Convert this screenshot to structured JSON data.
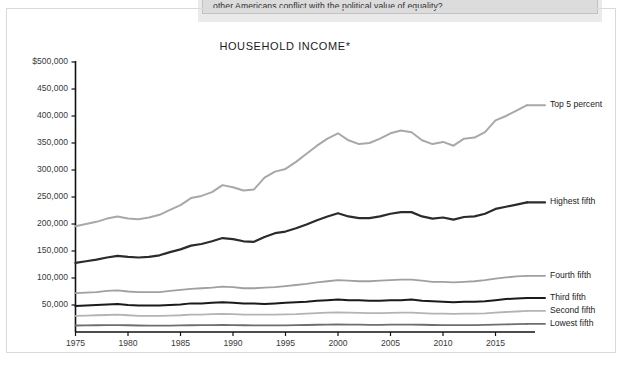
{
  "page": {
    "question_text": "other Americans conflict with the political value of equality?"
  },
  "chart_data": {
    "type": "line",
    "title": "HOUSEHOLD INCOME*",
    "xlabel": "",
    "ylabel": "",
    "grid": false,
    "legend_position": "right-of-line-ends",
    "xlim": [
      1975,
      2018
    ],
    "ylim": [
      0,
      500000
    ],
    "y_ticks": [
      500000,
      450000,
      400000,
      350000,
      300000,
      250000,
      200000,
      150000,
      100000,
      50000
    ],
    "y_tick_labels": [
      "$500,000",
      "450,000",
      "400,000",
      "350,000",
      "300,000",
      "250,000",
      "200,000",
      "150,000",
      "100,000",
      "50,000"
    ],
    "x_ticks": [
      1975,
      1980,
      1985,
      1990,
      1995,
      2000,
      2005,
      2010,
      2015
    ],
    "x_tick_labels": [
      "1975",
      "1980",
      "1985",
      "1990",
      "1995",
      "2000",
      "2005",
      "2010",
      "2015"
    ],
    "x": [
      1975,
      1976,
      1977,
      1978,
      1979,
      1980,
      1981,
      1982,
      1983,
      1984,
      1985,
      1986,
      1987,
      1988,
      1989,
      1990,
      1991,
      1992,
      1993,
      1994,
      1995,
      1996,
      1997,
      1998,
      1999,
      2000,
      2001,
      2002,
      2003,
      2004,
      2005,
      2006,
      2007,
      2008,
      2009,
      2010,
      2011,
      2012,
      2013,
      2014,
      2015,
      2016,
      2017,
      2018
    ],
    "series": [
      {
        "name": "Top 5 percent",
        "color": "#a8a8a8",
        "width": 2.0,
        "values": [
          196000,
          200000,
          204000,
          210000,
          214000,
          210000,
          209000,
          212000,
          217000,
          226000,
          235000,
          248000,
          252000,
          259000,
          272000,
          268000,
          262000,
          264000,
          286000,
          297000,
          302000,
          315000,
          330000,
          345000,
          358000,
          368000,
          355000,
          348000,
          350000,
          358000,
          368000,
          373000,
          370000,
          355000,
          348000,
          352000,
          345000,
          358000,
          360000,
          370000,
          392000,
          400000,
          410000,
          420000
        ]
      },
      {
        "name": "Highest fifth",
        "color": "#2b2b2b",
        "width": 2.2,
        "values": [
          128000,
          131000,
          134000,
          138000,
          141000,
          139000,
          138000,
          139000,
          142000,
          148000,
          153000,
          160000,
          163000,
          168000,
          174000,
          172000,
          168000,
          167000,
          176000,
          183000,
          186000,
          192000,
          199000,
          207000,
          214000,
          220000,
          214000,
          211000,
          211000,
          214000,
          219000,
          222000,
          222000,
          214000,
          210000,
          212000,
          208000,
          213000,
          214000,
          219000,
          228000,
          232000,
          236000,
          240000
        ]
      },
      {
        "name": "Fourth fifth",
        "color": "#a0a0a0",
        "width": 1.8,
        "values": [
          72000,
          73000,
          74000,
          76000,
          77000,
          75000,
          74000,
          74000,
          74000,
          76000,
          78000,
          80000,
          81000,
          82000,
          84000,
          83000,
          81000,
          81000,
          82000,
          83000,
          85000,
          87000,
          89000,
          92000,
          94000,
          96000,
          95000,
          94000,
          94000,
          95000,
          96000,
          97000,
          97000,
          95000,
          93000,
          93000,
          92000,
          93000,
          94000,
          96000,
          99000,
          101000,
          103000,
          104000
        ]
      },
      {
        "name": "Third fifth",
        "color": "#1a1a1a",
        "width": 2.0,
        "values": [
          48000,
          49000,
          50000,
          51000,
          52000,
          50000,
          49000,
          49000,
          49000,
          50000,
          51000,
          53000,
          53000,
          54000,
          55000,
          54000,
          53000,
          53000,
          52000,
          53000,
          54000,
          55000,
          56000,
          58000,
          59000,
          60000,
          59000,
          59000,
          58000,
          58000,
          59000,
          59000,
          60000,
          58000,
          57000,
          56000,
          55000,
          56000,
          56000,
          57000,
          59000,
          61000,
          62000,
          63000
        ]
      },
      {
        "name": "Second fifth",
        "color": "#b4b4b4",
        "width": 1.8,
        "values": [
          30000,
          30500,
          31000,
          31500,
          32000,
          31000,
          30000,
          30000,
          30000,
          30500,
          31000,
          32000,
          32000,
          33000,
          33500,
          33000,
          32000,
          32000,
          32000,
          32000,
          32500,
          33000,
          34000,
          35000,
          36000,
          36500,
          36000,
          35500,
          35000,
          35000,
          35500,
          36000,
          36000,
          35000,
          34000,
          34000,
          33500,
          34000,
          34000,
          34500,
          36000,
          37000,
          38000,
          39000
        ]
      },
      {
        "name": "Lowest fifth",
        "color": "#6e6e6e",
        "width": 1.8,
        "values": [
          12000,
          12200,
          12500,
          12700,
          12900,
          12500,
          12000,
          11800,
          11700,
          11900,
          12100,
          12500,
          12600,
          12800,
          13100,
          12900,
          12500,
          12300,
          12100,
          12200,
          12400,
          12700,
          13000,
          13400,
          13700,
          14000,
          13700,
          13500,
          13300,
          13300,
          13500,
          13700,
          13800,
          13400,
          13000,
          12900,
          12700,
          12800,
          12900,
          13100,
          13700,
          14200,
          14600,
          15000
        ]
      }
    ]
  }
}
